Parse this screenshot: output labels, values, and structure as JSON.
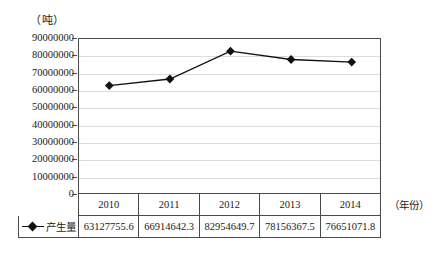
{
  "chart_data": {
    "type": "line",
    "title": "",
    "subtitle": "",
    "xlabel": "（年份）",
    "ylabel": "（吨）",
    "categories": [
      "2010",
      "2011",
      "2012",
      "2013",
      "2014"
    ],
    "series": [
      {
        "name": "产生量",
        "values": [
          63127755.6,
          66914642.3,
          82954649.7,
          78156367.5,
          76651071.8
        ],
        "color": "#111111",
        "marker": "diamond"
      }
    ],
    "ylim": [
      0,
      90000000
    ],
    "ytick_labels": [
      "90000000",
      "80000000",
      "70000000",
      "60000000",
      "50000000",
      "40000000",
      "30000000",
      "20000000",
      "10000000",
      "0"
    ],
    "ytick_values": [
      90000000,
      80000000,
      70000000,
      60000000,
      50000000,
      40000000,
      30000000,
      20000000,
      10000000,
      0
    ],
    "grid": true,
    "grid_axis": "y",
    "legend_position": "data-table-row"
  },
  "axis": {
    "y_unit_label": "（吨）",
    "x_unit_label": "（年份）"
  },
  "data_table": {
    "legend_label": "产生量",
    "header": [
      "2010",
      "2011",
      "2012",
      "2013",
      "2014"
    ],
    "values": [
      "63127755.6",
      "66914642.3",
      "82954649.7",
      "78156367.5",
      "76651071.8"
    ]
  },
  "bottom_caption": {
    "text": ""
  }
}
